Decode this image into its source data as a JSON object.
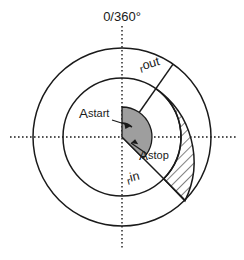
{
  "figure": {
    "title_label": "0/360°",
    "background_color": "#ffffff",
    "line_color": "#1a1a1a",
    "wedge_fill_color": "#9e9e9e"
  },
  "labels": {
    "angle_zero": "0/360°",
    "r_out_prefix": "r",
    "r_out_suffix": "out",
    "r_in_prefix": "r",
    "r_in_suffix": "in",
    "a_start_prefix": "A",
    "a_start_suffix": "start",
    "a_stop_prefix": "A",
    "a_stop_suffix": "stop"
  },
  "geometry": {
    "center_x": 122,
    "center_y": 137,
    "radius_outer": 89,
    "radius_inner": 59,
    "wedge_radius": 30,
    "angle_start_deg": 0,
    "angle_stop_deg": 135,
    "sector_start_deg": 35,
    "sector_stop_deg": 135
  }
}
